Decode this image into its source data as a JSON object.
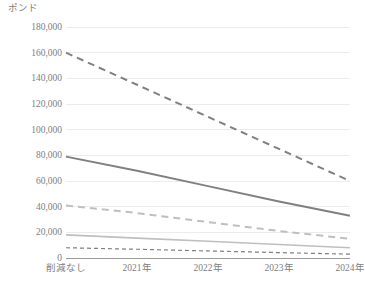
{
  "chart_data": {
    "type": "line",
    "title": "",
    "subtitle": "",
    "xlabel": "",
    "ylabel": "ポンド",
    "ylim": [
      0,
      180000
    ],
    "ytick_step": 20000,
    "ytick_labels": [
      "180,000",
      "160,000",
      "140,000",
      "120,000",
      "100,000",
      "80,000",
      "60,000",
      "40,000",
      "20,000",
      "0"
    ],
    "ytick_values": [
      180000,
      160000,
      140000,
      120000,
      100000,
      80000,
      60000,
      40000,
      20000,
      0
    ],
    "categories": [
      "削減なし",
      "2021年",
      "2022年",
      "2023年",
      "2024年"
    ],
    "grid": true,
    "grid_axis": "y",
    "legend": false,
    "legend_position": "none",
    "series": [
      {
        "name": "series-1",
        "values": [
          160000,
          135000,
          110000,
          85000,
          60000
        ],
        "style": "dashed",
        "color": "#808080",
        "width": 2.0
      },
      {
        "name": "series-2",
        "values": [
          79000,
          68000,
          56000,
          44000,
          33000
        ],
        "style": "solid",
        "color": "#808080",
        "width": 2.0
      },
      {
        "name": "series-3",
        "values": [
          41000,
          35000,
          28000,
          21000,
          15000
        ],
        "style": "dashed",
        "color": "#bfbfbf",
        "width": 2.0
      },
      {
        "name": "series-4",
        "values": [
          18000,
          15500,
          13000,
          10500,
          8000
        ],
        "style": "solid",
        "color": "#bfbfbf",
        "width": 1.6
      },
      {
        "name": "series-5",
        "values": [
          8000,
          6800,
          5500,
          4200,
          3000
        ],
        "style": "dashed",
        "color": "#808080",
        "width": 1.2
      }
    ]
  },
  "colors": {
    "gridline": "#ececec",
    "axis": "#9a9a9a",
    "text": "#808080",
    "background": "#ffffff",
    "series_dark": "#808080",
    "series_light": "#bfbfbf"
  }
}
